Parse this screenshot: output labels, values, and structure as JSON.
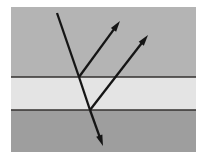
{
  "figure": {
    "canvas": {
      "width": 205,
      "height": 159,
      "background": "#ffffff"
    },
    "frame": {
      "x": 11,
      "y": 7,
      "width": 185,
      "height": 145
    },
    "layers": [
      {
        "name": "upper-medium",
        "label": "upper medium",
        "color": "#b4b4b4",
        "x": 11,
        "y": 7,
        "width": 185,
        "height": 70
      },
      {
        "name": "middle-medium",
        "label": "middle medium",
        "color": "#e4e4e4",
        "x": 11,
        "y": 77,
        "width": 185,
        "height": 33
      },
      {
        "name": "lower-medium",
        "label": "lower medium",
        "color": "#9e9e9e",
        "x": 11,
        "y": 110,
        "width": 185,
        "height": 42
      }
    ],
    "boundaries": [
      {
        "name": "upper-boundary",
        "y": 77,
        "x1": 11,
        "x2": 196,
        "color": "#33312f",
        "width": 1.6
      },
      {
        "name": "lower-boundary",
        "y": 110,
        "x1": 11,
        "x2": 196,
        "color": "#33312f",
        "width": 1.6
      }
    ],
    "interface_points": [
      {
        "name": "upper-interface-point",
        "x": 79,
        "y": 77
      },
      {
        "name": "lower-interface-point",
        "x": 90,
        "y": 110
      }
    ],
    "ray_color": "#151515",
    "ray_width": 2.3,
    "arrow_head_length": 11,
    "arrow_head_width": 6.5,
    "rays": [
      {
        "name": "incident-ray",
        "label": "incident ray",
        "x1": 57,
        "y1": 13,
        "x2": 79,
        "y2": 77,
        "arrow": false
      },
      {
        "name": "reflected-ray-upper",
        "label": "reflected ray at upper boundary",
        "x1": 79,
        "y1": 77,
        "x2": 120,
        "y2": 21,
        "arrow": true
      },
      {
        "name": "refracted-ray-middle",
        "label": "refracted ray inside middle medium",
        "x1": 79,
        "y1": 77,
        "x2": 90,
        "y2": 110,
        "arrow": false
      },
      {
        "name": "reflected-ray-lower",
        "label": "reflected ray at lower boundary",
        "x1": 90,
        "y1": 110,
        "x2": 148,
        "y2": 35,
        "arrow": true
      },
      {
        "name": "transmitted-ray-lower",
        "label": "transmitted ray into lower medium",
        "x1": 90,
        "y1": 110,
        "x2": 103,
        "y2": 146,
        "arrow": true
      }
    ]
  }
}
